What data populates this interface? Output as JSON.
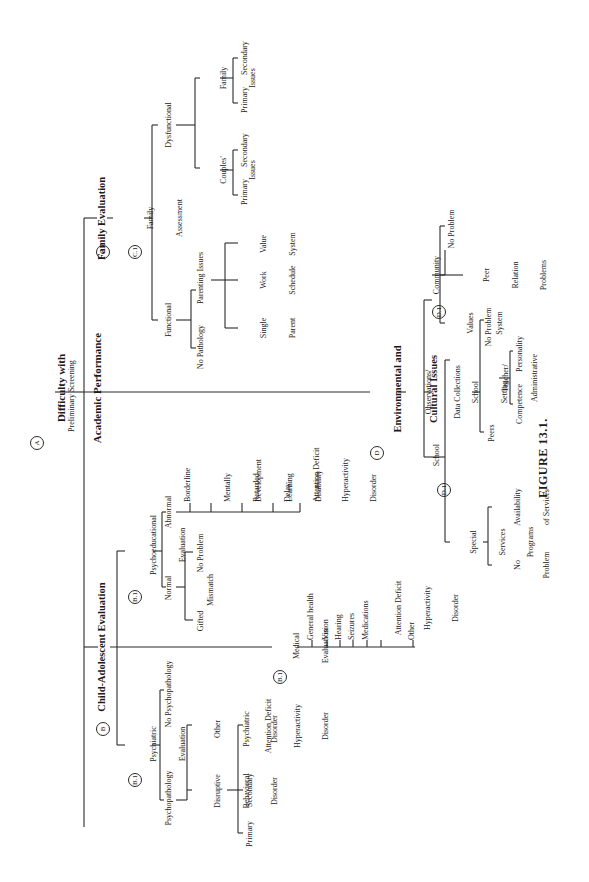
{
  "figure_caption": "FIGURE 13.1.",
  "root": {
    "badge": "A",
    "title_line1": "Difficulty with",
    "title_line2": "Academic Performance",
    "sub": "Preliminary Screening"
  },
  "branch_b": {
    "badge": "B",
    "title": "Child-Adolescent Evaluation",
    "psychiatric": {
      "badge": "B.1",
      "label_line1": "Psychiatric",
      "label_line2": "Evaluation",
      "no_psychopathology": "No Psychopathology",
      "psychopathology": "Psychopathology",
      "other_line1": "Other",
      "other_line2": "Psychiatric",
      "other_line3": "Disorder",
      "dbd_line1": "Disruptive",
      "dbd_line2": "Behavioral",
      "dbd_line3": "Disorder",
      "primary": "Primary",
      "secondary": "Secondary",
      "adhd_line1": "Attention Deficit",
      "adhd_line2": "Hyperactivity",
      "adhd_line3": "Disorder"
    },
    "psychoeducational": {
      "badge": "B.1",
      "label_line1": "Psychoeducational",
      "label_line2": "Evaluation",
      "normal": "Normal",
      "abnormal": "Abnormal",
      "gifted": "Gifted",
      "mismatch": "Mismatch",
      "no_problem": "No Problem",
      "abnormal_items": [
        {
          "line1": "Borderline",
          "line2": ""
        },
        {
          "line1": "Mentally",
          "line2": "Retarded"
        },
        {
          "line1": "Development",
          "line2": "Delay"
        },
        {
          "line1": "Learning",
          "line2": "Disability"
        },
        {
          "line1": "Attention Deficit",
          "line2": "Hyperactivity",
          "line3": "Disorder"
        }
      ]
    },
    "medical": {
      "badge": "B.1",
      "label_line1": "Medical",
      "label_line2": "Evaluation",
      "items": [
        "General health",
        "Vision",
        "Hearing",
        "Seizures",
        "Medications",
        "Attention Deficit",
        "Hyperactivity",
        "Disorder",
        "Other"
      ]
    }
  },
  "branch_c": {
    "badge": "C",
    "title": "Family Evaluation",
    "assessment_badge": "C.1",
    "assessment_line1": "Family",
    "assessment_line2": "Assessment",
    "functional": "Functional",
    "dysfunctional": "Dysfunctional",
    "no_pathology": "No Pathology",
    "parenting_issues": "Parenting Issues",
    "single_parent_line1": "Single",
    "single_parent_line2": "Parent",
    "work_schedule_line1": "Work",
    "work_schedule_line2": "Schedule",
    "value_system_line1": "Value",
    "value_system_line2": "System",
    "couples_line1": "Couples'",
    "couples_line2": "Issues",
    "family_issues_line1": "Family",
    "family_issues_line2": "Issues",
    "primary": "Primary",
    "secondary": "Secondary"
  },
  "branch_d": {
    "badge": "D",
    "title_line1": "Environmental and",
    "title_line2": "Cultural Issues",
    "obs_line1": "Observations/",
    "obs_line2": "Data Collections",
    "school_badge": "D.1",
    "school": "School",
    "community_badge": "D.1",
    "community": "Community",
    "values_system_line1": "Values",
    "values_system_line2": "System",
    "peer_rel_line1": "Peer",
    "peer_rel_line2": "Relation",
    "peer_rel_line3": "Problems",
    "no_problem": "No Problem",
    "special_line1": "Special",
    "special_line2": "Services",
    "special_line3": "Programs",
    "availability_line1": "Availability",
    "availability_line2": "of Services",
    "no_problem2_line1": "No",
    "no_problem2_line2": "Problem",
    "school_setting_line1": "School",
    "school_setting_line2": "Setting",
    "peers": "Peers",
    "teacher_line1": "Teacher/",
    "teacher_line2": "Administrative",
    "competence": "Competence",
    "personality": "Personality",
    "no_problem3": "No Problem"
  }
}
